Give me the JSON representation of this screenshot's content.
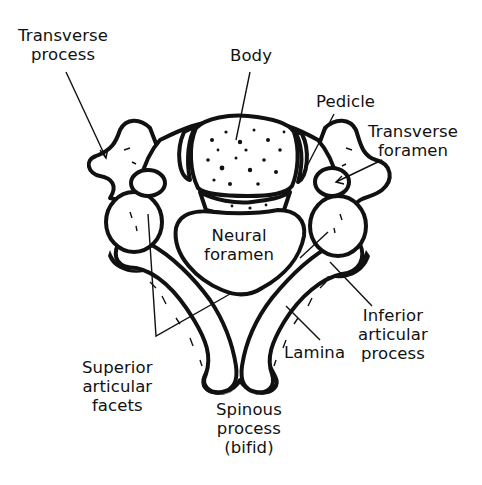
{
  "diagram": {
    "colors": {
      "ink": "#111111",
      "bone_fill": "#ffffff",
      "background": "#ffffff"
    },
    "labels": {
      "transverse_process": {
        "line1": "Transverse",
        "line2": "process"
      },
      "body": {
        "line1": "Body"
      },
      "pedicle": {
        "line1": "Pedicle"
      },
      "transverse_foramen": {
        "line1": "Transverse",
        "line2": "foramen"
      },
      "neural_foramen": {
        "line1": "Neural",
        "line2": "foramen"
      },
      "inferior_articular_process": {
        "line1": "Inferior",
        "line2": "articular",
        "line3": "process"
      },
      "lamina": {
        "line1": "Lamina"
      },
      "superior_articular_facets": {
        "line1": "Superior",
        "line2": "articular",
        "line3": "facets"
      },
      "spinous_process": {
        "line1": "Spinous",
        "line2": "process",
        "line3": "(bifid)"
      }
    }
  }
}
